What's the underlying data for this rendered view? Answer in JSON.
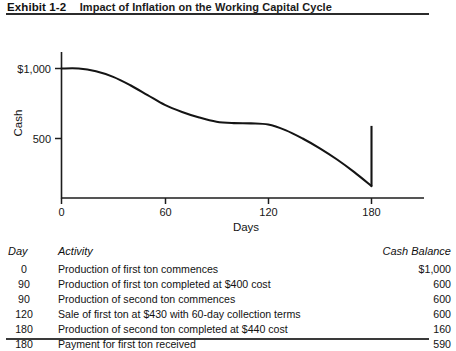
{
  "exhibit": {
    "label": "Exhibit 1-2",
    "title": "Impact of Inflation on the Working Capital Cycle"
  },
  "chart_data": {
    "type": "line",
    "title": "Impact of Inflation on the Working Capital Cycle",
    "xlabel": "Days",
    "ylabel": "Cash",
    "xlim": [
      0,
      195
    ],
    "ylim": [
      0,
      1100
    ],
    "xticks": [
      0,
      60,
      120,
      180
    ],
    "xtick_labels": [
      "0",
      "60",
      "120",
      "180"
    ],
    "yticks": [
      500,
      1000
    ],
    "ytick_labels": [
      "500",
      "$1,000"
    ],
    "grid": false,
    "legend": "none",
    "series": [
      {
        "name": "Cash Balance",
        "x": [
          0,
          10,
          20,
          30,
          40,
          50,
          60,
          70,
          80,
          90,
          100,
          110,
          120,
          130,
          140,
          150,
          160,
          170,
          180
        ],
        "y": [
          1000,
          1000,
          980,
          940,
          880,
          810,
          740,
          690,
          650,
          620,
          610,
          608,
          600,
          560,
          500,
          430,
          350,
          260,
          160
        ]
      },
      {
        "name": "Payment received jump",
        "x": [
          180,
          180
        ],
        "y": [
          160,
          590
        ]
      }
    ],
    "annotations": []
  },
  "table": {
    "headers": [
      "Day",
      "Activity",
      "Cash Balance"
    ],
    "rows": [
      {
        "day": "0",
        "activity": "Production of first ton commences",
        "balance": "$1,000"
      },
      {
        "day": "90",
        "activity": "Production of first ton completed at $400 cost",
        "balance": "600"
      },
      {
        "day": "90",
        "activity": "Production of second ton commences",
        "balance": "600"
      },
      {
        "day": "120",
        "activity": "Sale of first ton at $430 with 60-day collection terms",
        "balance": "600"
      },
      {
        "day": "180",
        "activity": "Production of second ton completed at $440 cost",
        "balance": "160"
      },
      {
        "day": "180",
        "activity": "Payment for first ton received",
        "balance": "590"
      }
    ]
  },
  "colors": {
    "ink": "#1a1a1a",
    "rule": "#2b2b2b",
    "curve": "#141414",
    "background": "#ffffff"
  }
}
